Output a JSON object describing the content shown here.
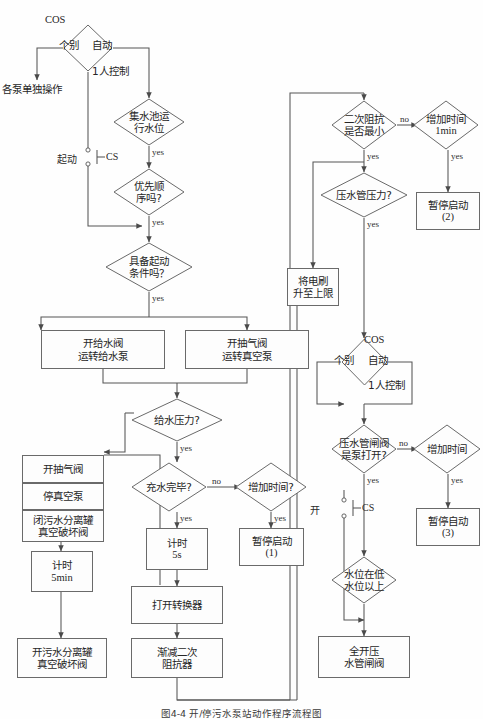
{
  "figure": {
    "caption": "图4-4   开/停污水泵站动作程序流程图",
    "type": "flowchart",
    "orientation": "top-to-bottom"
  },
  "labels": {
    "yes": "yes",
    "no": "no",
    "cos": "COS",
    "cs": "CS",
    "geibie": "个别",
    "zidong": "自动",
    "one_person_control": "1人控制",
    "qidong": "起动",
    "kai": "开"
  },
  "nodes": {
    "cos_top": {
      "kind": "decision",
      "label": "",
      "marker": "COS"
    },
    "each_pump_manual": {
      "kind": "text",
      "label": "各泵单独操作"
    },
    "start_cs_switch": {
      "kind": "switch",
      "label": "起动",
      "device": "CS"
    },
    "sump_level": {
      "kind": "decision",
      "line1": "集水池运",
      "line2": "行水位"
    },
    "priority_order": {
      "kind": "decision",
      "line1": "优先顺",
      "line2": "序吗?"
    },
    "start_conditions": {
      "kind": "decision",
      "line1": "具备起动",
      "line2": "条件吗？"
    },
    "open_feedwater": {
      "kind": "process",
      "line1": "开给水阀",
      "line2": "运转给水泵"
    },
    "open_airvalve": {
      "kind": "process",
      "line1": "开抽气阀",
      "line2": "运转真空泵"
    },
    "feed_pressure": {
      "kind": "decision",
      "line1": "给水压力?"
    },
    "fill_complete": {
      "kind": "decision",
      "line1": "充水完毕?"
    },
    "add_time_1": {
      "kind": "decision",
      "line1": "增加时间?"
    },
    "pause_start_1": {
      "kind": "process",
      "line1": "暂停启动",
      "line2": "(1)"
    },
    "timer_5s": {
      "kind": "process",
      "line1": "计时",
      "line2": "5s"
    },
    "open_converter": {
      "kind": "process",
      "line1": "打开转换器"
    },
    "reduce_secondary": {
      "kind": "process",
      "line1": "渐减二次",
      "line2": "阻抗器"
    },
    "open_airvalve_2": {
      "kind": "process",
      "line1": "开抽气阀"
    },
    "stop_vacuum": {
      "kind": "process",
      "line1": "停真空泵"
    },
    "close_sewage_sep": {
      "kind": "process",
      "line1": "闭污水分离罐",
      "line2": "真空破坏阀"
    },
    "timer_5min": {
      "kind": "process",
      "line1": "计时",
      "line2": "5min"
    },
    "open_sewage_sep": {
      "kind": "process",
      "line1": "开污水分离罐",
      "line2": "真空破坏阀"
    },
    "secondary_min": {
      "kind": "decision",
      "line1": "二次阻抗",
      "line2": "是否最小"
    },
    "add_time_1min": {
      "kind": "decision",
      "line1": "增加时间",
      "line2": "1min"
    },
    "pause_start_2": {
      "kind": "process",
      "line1": "暂停启动",
      "line2": "(2)"
    },
    "press_pipe_pressure": {
      "kind": "decision",
      "line1": "压水管压力?"
    },
    "raise_brush": {
      "kind": "process",
      "line1": "将电刷",
      "line2": "升至上限"
    },
    "cos_lower": {
      "kind": "decision",
      "label": "",
      "marker": "COS"
    },
    "press_gate_open": {
      "kind": "decision",
      "line1": "压水管闸阀",
      "line2": "是泵打开?"
    },
    "add_time_2": {
      "kind": "decision",
      "line1": "增加时间"
    },
    "pause_auto_3": {
      "kind": "process",
      "line1": "暂停自动",
      "line2": "(3)"
    },
    "open_cs_switch": {
      "kind": "switch",
      "label": "开",
      "device": "CS"
    },
    "level_above_low": {
      "kind": "decision",
      "line1": "水位在低",
      "line2": "水位以上"
    },
    "fully_open_gate": {
      "kind": "process",
      "line1": "全开压",
      "line2": "水管闸阀"
    }
  },
  "colors": {
    "line": "#555555",
    "node_border": "#6a6a6a",
    "node_fill": "#fdfdfd",
    "text": "#262626",
    "background": "#ffffff"
  }
}
